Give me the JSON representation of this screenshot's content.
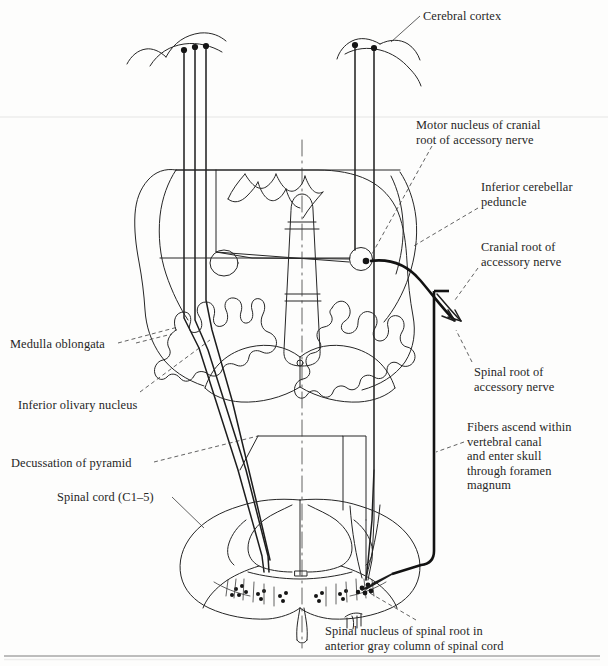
{
  "figure": {
    "kind": "anatomical-line-diagram",
    "ink_color": "#262626",
    "heavy_ink_color": "#111111",
    "background_color": "#fdfdfc"
  },
  "labels": {
    "cerebral_cortex": "Cerebral cortex",
    "motor_nucleus": "Motor nucleus of cranial\nroot of accessory nerve",
    "inferior_cerebellar_peduncle": "Inferior cerebellar\npeduncle",
    "cranial_root": "Cranial root of\naccessory nerve",
    "spinal_root": "Spinal root of\naccessory nerve",
    "fibers_ascend": "Fibers ascend within\nvertebral canal\nand enter skull\nthrough foramen\nmagnum",
    "medulla_oblongata": "Medulla oblongata",
    "inferior_olivary_nucleus": "Inferior olivary nucleus",
    "decussation_of_pyramid": "Decussation of pyramid",
    "spinal_cord": "Spinal cord (C1–5)",
    "spinal_nucleus": "Spinal nucleus of spinal root in\nanterior gray column of spinal cord"
  },
  "structures": {
    "cortex_left_neurons": 3,
    "cortex_right_neurons": 2,
    "motor_nucleus_marker": "circle-with-dot",
    "spinal_nucleus_marker": "dotted-cell-cluster",
    "midline": "vertical-dash-dot-axis",
    "sections": [
      "cerebral cortex (upper)",
      "medulla oblongata (middle, transverse outline)",
      "spinal cord C1-5 (lower, transverse outline)"
    ]
  },
  "rules": {
    "top_faint_rule": "faint horizontal page rule",
    "bottom_rule": "horizontal page rule"
  }
}
